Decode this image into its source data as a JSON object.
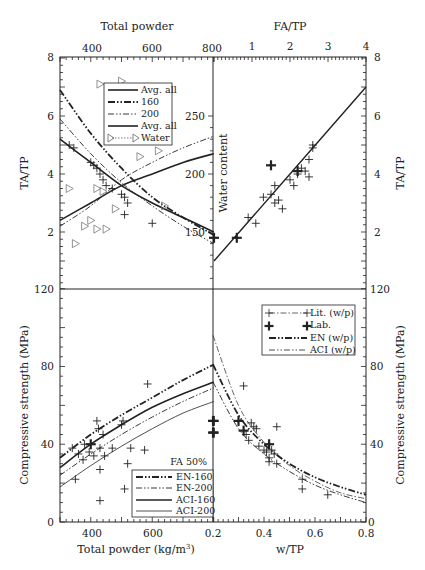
{
  "chart_data": [
    {
      "panel": "top-left",
      "type": "line",
      "title": "",
      "top_xlabel": "Total powder",
      "ylabel_left": "TA/TP",
      "ylabel_right_inner": "Water content",
      "x_ticks": [
        "400",
        "600",
        "800"
      ],
      "xlim": [
        300,
        800
      ],
      "ylim_left": [
        0,
        8
      ],
      "y_ticks_left": [
        "2",
        "4",
        "6",
        "8"
      ],
      "y_ticks_water": [
        "150",
        "200",
        "250"
      ],
      "legend": [
        "Avg. all",
        "160",
        "200",
        "Avg. all",
        "Water"
      ],
      "series": [
        {
          "name": "Avg. all (TA/TP)",
          "x": [
            300,
            400,
            500,
            600,
            700,
            800
          ],
          "y": [
            5.2,
            4.4,
            3.6,
            3.0,
            2.5,
            2.0
          ]
        },
        {
          "name": "160",
          "x": [
            300,
            400,
            500,
            600,
            700,
            800
          ],
          "y": [
            6.9,
            5.4,
            4.2,
            3.2,
            2.5,
            1.9
          ]
        },
        {
          "name": "200",
          "x": [
            300,
            400,
            500,
            600,
            700,
            800
          ],
          "y": [
            5.9,
            4.7,
            3.7,
            2.9,
            2.2,
            1.6
          ]
        },
        {
          "name": "Avg. all (water)",
          "x": [
            300,
            400,
            500,
            600,
            700,
            800
          ],
          "y": [
            2.4,
            3.0,
            3.6,
            4.0,
            4.4,
            4.7
          ]
        },
        {
          "name": "Water content trend (dash-dot)",
          "x": [
            300,
            400,
            500,
            600,
            700,
            800
          ],
          "y": [
            2.2,
            2.9,
            3.8,
            4.4,
            4.9,
            5.3
          ]
        }
      ],
      "scatter_plus": [
        [
          330,
          5.0
        ],
        [
          345,
          4.9
        ],
        [
          400,
          4.4
        ],
        [
          410,
          4.3
        ],
        [
          420,
          4.2
        ],
        [
          430,
          4.0
        ],
        [
          440,
          3.8
        ],
        [
          450,
          3.6
        ],
        [
          470,
          3.5
        ],
        [
          500,
          3.3
        ],
        [
          510,
          3.2
        ],
        [
          520,
          3.0
        ],
        [
          510,
          2.6
        ],
        [
          600,
          2.3
        ]
      ],
      "scatter_triangles": [
        [
          430,
          7.1
        ],
        [
          500,
          7.2
        ],
        [
          330,
          3.5
        ],
        [
          420,
          3.5
        ],
        [
          440,
          3.4
        ],
        [
          380,
          2.2
        ],
        [
          400,
          2.4
        ],
        [
          420,
          2.1
        ],
        [
          450,
          2.1
        ],
        [
          480,
          2.8
        ],
        [
          350,
          1.6
        ],
        [
          560,
          4.6
        ],
        [
          620,
          4.8
        ],
        [
          640,
          2.9
        ]
      ]
    },
    {
      "panel": "top-right",
      "type": "scatter",
      "top_xlabel": "FA/TP",
      "x_ticks": [
        "1",
        "2",
        "3",
        "4"
      ],
      "xlim": [
        0,
        4
      ],
      "ylabel_right": "TA/TP",
      "y_ticks_right": [
        "2",
        "4",
        "6",
        "8"
      ],
      "ylim": [
        0,
        8
      ],
      "series": [
        {
          "name": "Linear fit",
          "x": [
            0,
            4
          ],
          "y": [
            1.0,
            7.0
          ]
        }
      ],
      "scatter_plus": [
        [
          0.9,
          2.5
        ],
        [
          1.1,
          2.3
        ],
        [
          1.3,
          3.2
        ],
        [
          1.5,
          3.3
        ],
        [
          1.6,
          3.0
        ],
        [
          1.6,
          3.6
        ],
        [
          1.7,
          3.1
        ],
        [
          1.8,
          2.8
        ],
        [
          2.0,
          3.8
        ],
        [
          2.1,
          3.6
        ],
        [
          2.2,
          4.0
        ],
        [
          2.3,
          4.2
        ],
        [
          2.4,
          4.1
        ],
        [
          2.5,
          3.9
        ],
        [
          2.5,
          4.5
        ],
        [
          2.6,
          4.9
        ],
        [
          2.6,
          5.0
        ]
      ],
      "scatter_bold_plus": [
        [
          0.6,
          1.8
        ],
        [
          1.5,
          4.3
        ],
        [
          2.2,
          4.1
        ],
        [
          0,
          1.8
        ]
      ]
    },
    {
      "panel": "bottom-left",
      "type": "line",
      "xlabel": "Total powder (kg/m³)",
      "ylabel": "Compressive strength (MPa)",
      "x_ticks": [
        "400",
        "600",
        "0.2"
      ],
      "xlim": [
        300,
        800
      ],
      "y_ticks": [
        "0",
        "40",
        "80",
        "120"
      ],
      "ylim": [
        0,
        120
      ],
      "annotation": "FA 50%",
      "legend": [
        "EN-160",
        "EN-200",
        "ACI-160",
        "ACI-200"
      ],
      "series": [
        {
          "name": "EN-160",
          "x": [
            300,
            400,
            500,
            600,
            700,
            800
          ],
          "y": [
            33,
            45,
            55,
            64,
            73,
            81
          ]
        },
        {
          "name": "EN-200",
          "x": [
            300,
            400,
            500,
            600,
            700,
            800
          ],
          "y": [
            24,
            35,
            45,
            54,
            62,
            69
          ]
        },
        {
          "name": "ACI-160",
          "x": [
            300,
            400,
            500,
            600,
            700,
            800
          ],
          "y": [
            28,
            40,
            50,
            59,
            66,
            72
          ]
        },
        {
          "name": "ACI-200",
          "x": [
            300,
            400,
            500,
            600,
            700,
            800
          ],
          "y": [
            18,
            29,
            39,
            48,
            56,
            62
          ]
        }
      ],
      "scatter_plus": [
        [
          340,
          38
        ],
        [
          350,
          22
        ],
        [
          360,
          35
        ],
        [
          375,
          32
        ],
        [
          380,
          40
        ],
        [
          395,
          36
        ],
        [
          410,
          34
        ],
        [
          420,
          52
        ],
        [
          425,
          48
        ],
        [
          430,
          38
        ],
        [
          430,
          27
        ],
        [
          430,
          11
        ],
        [
          440,
          45
        ],
        [
          445,
          34
        ],
        [
          470,
          38
        ],
        [
          500,
          50
        ],
        [
          505,
          52
        ],
        [
          510,
          17
        ],
        [
          520,
          30
        ],
        [
          530,
          38
        ],
        [
          575,
          37
        ],
        [
          585,
          71
        ]
      ],
      "scatter_bold_plus": [
        [
          400,
          40
        ],
        [
          800,
          52
        ],
        [
          800,
          46
        ]
      ]
    },
    {
      "panel": "bottom-right",
      "type": "line",
      "xlabel": "w/TP",
      "ylabel_right": "Compressive strength (MPa)",
      "x_ticks": [
        "0.2",
        "0.4",
        "0.6",
        "0.8"
      ],
      "xlim": [
        0.2,
        0.8
      ],
      "y_ticks_right": [
        "0",
        "40",
        "80",
        "120"
      ],
      "ylim": [
        0,
        120
      ],
      "legend": [
        "Lit. (w/p)",
        "Lab.",
        "EN (w/p)",
        "ACI (w/p)"
      ],
      "series": [
        {
          "name": "EN (w/p)",
          "x": [
            0.2,
            0.3,
            0.4,
            0.5,
            0.6,
            0.7,
            0.8
          ],
          "y": [
            81,
            55,
            40,
            30,
            23,
            18,
            14
          ]
        },
        {
          "name": "ACI (w/p)",
          "x": [
            0.2,
            0.3,
            0.4,
            0.5,
            0.6,
            0.7,
            0.8
          ],
          "y": [
            72,
            48,
            35,
            26,
            19,
            14,
            10
          ]
        },
        {
          "name": "Lit. (w/p)",
          "x": [
            0.2,
            0.3,
            0.4,
            0.5,
            0.6,
            0.7,
            0.8
          ],
          "y": [
            96,
            60,
            41,
            29,
            21,
            15,
            12
          ]
        }
      ],
      "scatter_plus": [
        [
          0.32,
          70
        ],
        [
          0.33,
          45
        ],
        [
          0.34,
          42
        ],
        [
          0.35,
          51
        ],
        [
          0.36,
          49
        ],
        [
          0.37,
          48
        ],
        [
          0.38,
          39
        ],
        [
          0.4,
          37
        ],
        [
          0.41,
          36
        ],
        [
          0.42,
          33
        ],
        [
          0.42,
          31
        ],
        [
          0.43,
          37
        ],
        [
          0.44,
          35
        ],
        [
          0.45,
          49
        ],
        [
          0.45,
          30
        ],
        [
          0.55,
          22
        ],
        [
          0.55,
          17
        ],
        [
          0.65,
          14
        ]
      ],
      "scatter_bold_plus": [
        [
          0.3,
          52
        ],
        [
          0.32,
          47
        ],
        [
          0.42,
          40
        ],
        [
          0.2,
          52
        ],
        [
          0.2,
          46
        ]
      ]
    }
  ],
  "labels": {
    "top_left_axis_title": "Total powder",
    "top_right_axis_title": "FA/TP",
    "left_top_ylabel": "TA/TP",
    "right_top_ylabel": "TA/TP",
    "water_content": "Water content",
    "left_bottom_ylabel": "Compressive strength (MPa)",
    "right_bottom_ylabel": "Compressive strength (MPa)",
    "bottom_left_xlabel": "Total powder (kg/m",
    "bottom_left_xlabel_sup": "3",
    "bottom_left_xlabel_close": ")",
    "bottom_right_xlabel": "w/TP",
    "fa_note": "FA 50%"
  },
  "ticks": {
    "tp_top": [
      "400",
      "600",
      "800"
    ],
    "fa_top": [
      "1",
      "2",
      "3",
      "4"
    ],
    "tatp_left": [
      "8",
      "6",
      "4",
      "2"
    ],
    "tatp_right": [
      "8",
      "6",
      "4",
      "2"
    ],
    "water": [
      "250",
      "200",
      "150"
    ],
    "mpa_left": [
      "120",
      "80",
      "40",
      "0"
    ],
    "mpa_right": [
      "120",
      "80",
      "40",
      "0"
    ],
    "tp_bottom": [
      "400",
      "600"
    ],
    "wtp_bottom": [
      "0.2",
      "0.4",
      "0.6",
      "0.8"
    ]
  },
  "legend_top": [
    "Avg. all",
    "160",
    "200",
    "Avg. all",
    "Water"
  ],
  "legend_bl": [
    "EN-160",
    "EN-200",
    "ACI-160",
    "ACI-200"
  ],
  "legend_br": [
    "Lit. (w/p)",
    "Lab.",
    "EN (w/p)",
    "ACI (w/p)"
  ]
}
